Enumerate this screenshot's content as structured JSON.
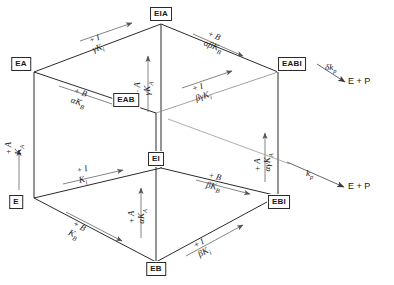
{
  "diagram": {
    "type": "reaction-scheme-cube",
    "stroke_color": "#2a2a2a",
    "background": "#ffffff"
  },
  "nodes": [
    {
      "id": "E",
      "label": "E",
      "x": 16,
      "y": 202
    },
    {
      "id": "EA",
      "label": "EA",
      "x": 21,
      "y": 64
    },
    {
      "id": "EB",
      "label": "EB",
      "x": 156,
      "y": 269
    },
    {
      "id": "EAB",
      "label": "EAB",
      "x": 126,
      "y": 100
    },
    {
      "id": "EI",
      "label": "EI",
      "x": 156,
      "y": 159
    },
    {
      "id": "EIA",
      "label": "EIA",
      "x": 161,
      "y": 14
    },
    {
      "id": "EBI",
      "label": "EBI",
      "x": 279,
      "y": 202
    },
    {
      "id": "EABI",
      "label": "EABI",
      "x": 292,
      "y": 64
    }
  ],
  "products": [
    {
      "id": "product-top",
      "label": "E + P",
      "x": 348,
      "y": 81
    },
    {
      "id": "product-bottom",
      "label": "E + P",
      "x": 348,
      "y": 186
    }
  ],
  "edges": [
    {
      "id": "E-EA",
      "reagent": "+ A",
      "constant_html": "K<sub>A</sub>",
      "constant": "K_A"
    },
    {
      "id": "E-EB",
      "reagent": "+ B",
      "constant_html": "K<sub>B</sub>",
      "constant": "K_B"
    },
    {
      "id": "E-EI",
      "reagent": "+ I",
      "constant_html": "K<sub>i</sub>",
      "constant": "K_i"
    },
    {
      "id": "EA-EAB",
      "reagent": "+ B",
      "constant_html": "αK<sub>B</sub>",
      "constant": "alphaK_B"
    },
    {
      "id": "EA-EIA",
      "reagent": "+ I",
      "constant_html": "γK<sub>i</sub>",
      "constant": "gammaK_i"
    },
    {
      "id": "EB-EAB",
      "reagent": "+ A",
      "constant_html": "αK<sub>A</sub>",
      "constant": "alphaK_A"
    },
    {
      "id": "EB-EBI",
      "reagent": "+ I",
      "constant_html": "βK<sub>i</sub>",
      "constant": "betaK_i"
    },
    {
      "id": "EI-EIA",
      "reagent": "+ A",
      "constant_html": "γK<sub>A</sub>",
      "constant": "gammaK_A"
    },
    {
      "id": "EI-EBI",
      "reagent": "+ B",
      "constant_html": "βK<sub>B</sub>",
      "constant": "betaK_B"
    },
    {
      "id": "EAB-EABI",
      "reagent": "+ I",
      "constant_html": "βγK<sub>i</sub>",
      "constant": "betagammaK_i"
    },
    {
      "id": "EIA-EABI",
      "reagent": "+ B",
      "constant_html": "αβK<sub>B</sub>",
      "constant": "alphabetaK_B"
    },
    {
      "id": "EBI-EABI",
      "reagent": "+ A",
      "constant_html": "αγK<sub>A</sub>",
      "constant": "alphagammaK_A"
    }
  ],
  "catalytic_steps": [
    {
      "id": "EABI-product",
      "rate_html": "δk<sub>p</sub>",
      "rate": "delta k_p",
      "from": "EABI",
      "to": "E + P"
    },
    {
      "id": "EAB-product",
      "rate_html": "k<sub>p</sub>",
      "rate": "k_p",
      "from": "EAB",
      "to": "E + P"
    }
  ]
}
